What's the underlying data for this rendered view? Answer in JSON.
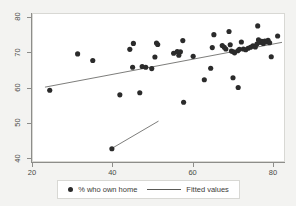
{
  "chart_data": {
    "type": "scatter",
    "title": "",
    "xlabel": "",
    "ylabel": "",
    "xlim": [
      20,
      83
    ],
    "ylim": [
      39,
      81
    ],
    "xticks": [
      20,
      40,
      60,
      80
    ],
    "yticks": [
      40,
      50,
      60,
      70,
      80
    ],
    "grid": false,
    "legend_position": "bottom",
    "legend": [
      {
        "label": "% who own home",
        "marker": "filled-circle",
        "color": "#2b2b2b"
      },
      {
        "label": "Fitted values",
        "marker": "line",
        "color": "#5a5a57"
      }
    ],
    "series": [
      {
        "name": "% who own home",
        "marker": "filled-circle",
        "color": "#2b2b2b",
        "points": [
          [
            24.2,
            59.2
          ],
          [
            31.2,
            69.6
          ],
          [
            35.0,
            67.7
          ],
          [
            41.8,
            57.9
          ],
          [
            44.3,
            70.9
          ],
          [
            45.2,
            72.6
          ],
          [
            45.0,
            65.8
          ],
          [
            46.8,
            58.5
          ],
          [
            47.4,
            66.0
          ],
          [
            48.3,
            65.8
          ],
          [
            49.8,
            65.4
          ],
          [
            50.6,
            68.7
          ],
          [
            51.3,
            72.3
          ],
          [
            51.0,
            72.7
          ],
          [
            55.3,
            69.8
          ],
          [
            56.2,
            70.3
          ],
          [
            56.6,
            69.2
          ],
          [
            57.0,
            70.2
          ],
          [
            57.6,
            73.4
          ],
          [
            57.8,
            55.8
          ],
          [
            60.2,
            68.9
          ],
          [
            63.0,
            62.2
          ],
          [
            64.6,
            65.5
          ],
          [
            65.0,
            71.4
          ],
          [
            65.4,
            75.1
          ],
          [
            67.5,
            72.0
          ],
          [
            68.0,
            71.5
          ],
          [
            68.4,
            71.0
          ],
          [
            69.2,
            76.0
          ],
          [
            69.5,
            72.2
          ],
          [
            69.8,
            70.4
          ],
          [
            70.3,
            70.2
          ],
          [
            70.6,
            69.9
          ],
          [
            70.2,
            62.8
          ],
          [
            71.4,
            70.5
          ],
          [
            71.8,
            70.9
          ],
          [
            71.5,
            60.0
          ],
          [
            72.3,
            73.0
          ],
          [
            72.8,
            71.0
          ],
          [
            73.4,
            70.8
          ],
          [
            74.0,
            71.2
          ],
          [
            74.6,
            71.5
          ],
          [
            75.2,
            71.9
          ],
          [
            75.8,
            71.6
          ],
          [
            76.2,
            72.4
          ],
          [
            76.6,
            73.6
          ],
          [
            76.4,
            77.6
          ],
          [
            77.0,
            72.9
          ],
          [
            77.4,
            73.2
          ],
          [
            77.8,
            72.6
          ],
          [
            78.2,
            73.3
          ],
          [
            78.6,
            73.0
          ],
          [
            79.0,
            73.5
          ],
          [
            79.4,
            72.8
          ],
          [
            79.8,
            68.8
          ],
          [
            81.4,
            74.7
          ],
          [
            39.8,
            42.5
          ]
        ]
      }
    ],
    "fit_lines": [
      {
        "name": "Fitted values",
        "color": "#5a5a57",
        "from": [
          23.0,
          60.1
        ],
        "to": [
          82.5,
          72.9
        ]
      },
      {
        "name": "Fitted values",
        "color": "#5a5a57",
        "from": [
          39.8,
          42.6
        ],
        "to": [
          51.5,
          50.4
        ]
      }
    ]
  }
}
